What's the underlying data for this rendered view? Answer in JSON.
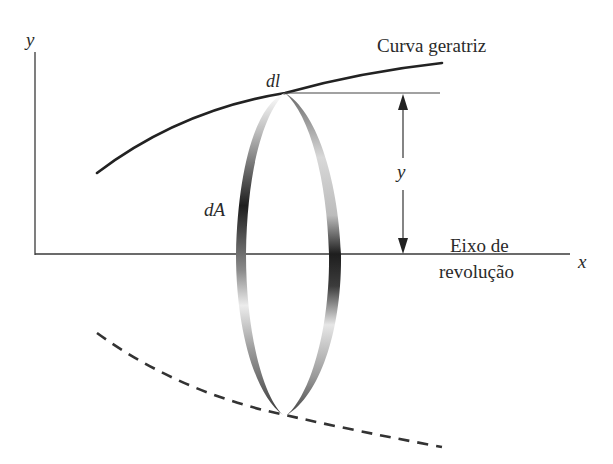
{
  "diagram": {
    "labels": {
      "y_axis": "y",
      "x_axis": "x",
      "curve": "Curva geratriz",
      "dl": "dl",
      "dA": "dA",
      "y_dimension": "y",
      "axis_line1": "Eixo de",
      "axis_line2": "revolução"
    },
    "elements": [
      {
        "id": "y-axis",
        "type": "axis-line"
      },
      {
        "id": "x-axis",
        "type": "axis-line",
        "role": "axis of revolution"
      },
      {
        "id": "generating-curve",
        "type": "solid-curve"
      },
      {
        "id": "mirrored-curve",
        "type": "dashed-curve"
      },
      {
        "id": "surface-ring",
        "type": "shaded-ellipse-band",
        "represents": "dA"
      },
      {
        "id": "radius-dimension",
        "type": "double-arrow",
        "represents": "y"
      }
    ],
    "colors": {
      "ink": "#2a2a2a",
      "ring_dark": "#1e1e1e",
      "ring_light": "#e6e6e6",
      "background": "#ffffff"
    }
  }
}
